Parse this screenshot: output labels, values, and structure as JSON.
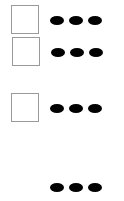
{
  "rows": [
    {
      "checkbox": {
        "checked": false,
        "top": 5,
        "left": 11
      },
      "menu": {
        "icon": "more-horizontal-icon",
        "top": 15
      }
    },
    {
      "checkbox": {
        "checked": false,
        "top": 37,
        "left": 12
      },
      "menu": {
        "icon": "more-horizontal-icon",
        "top": 47
      }
    },
    {
      "checkbox": {
        "checked": false,
        "top": 93,
        "left": 11
      },
      "menu": {
        "icon": "more-horizontal-icon",
        "top": 103
      }
    },
    {
      "checkbox": null,
      "menu": {
        "icon": "more-horizontal-icon",
        "top": 182
      }
    }
  ],
  "colors": {
    "border": "#9a9a9a",
    "dot": "#000000",
    "background": "#ffffff"
  }
}
